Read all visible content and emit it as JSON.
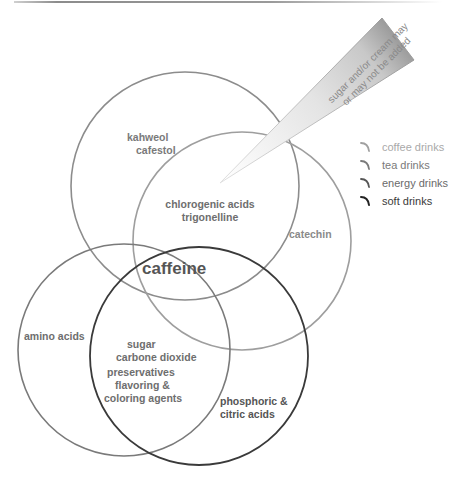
{
  "diagram": {
    "type": "venn",
    "sets": [
      {
        "id": "coffee",
        "legend_label": "coffee drinks",
        "color": "#b8b8b8",
        "stroke": "#8a8a8a",
        "exclusive_labels": [
          "kahweol",
          "cafestol"
        ]
      },
      {
        "id": "tea",
        "legend_label": "tea drinks",
        "color": "#8a8a8a",
        "stroke": "#9a9a9a",
        "exclusive_labels": [
          "catechin"
        ]
      },
      {
        "id": "energy",
        "legend_label": "energy drinks",
        "color": "#606060",
        "stroke": "#7a7a7a",
        "exclusive_labels": [
          "amino acids"
        ]
      },
      {
        "id": "soft",
        "legend_label": "soft drinks",
        "color": "#2e2e2e",
        "stroke": "#3a3a3a",
        "exclusive_labels": [
          "phosphoric &",
          "citric acids"
        ]
      }
    ],
    "shared_labels": {
      "coffee_tea": [
        "chlorogenic acids",
        "trigonelline"
      ],
      "all": "caffeine",
      "energy_soft": [
        "sugar",
        "carbone dioxide",
        "preservatives",
        "flavoring &",
        "coloring agents"
      ]
    },
    "callout": {
      "line1": "sugar and/or cream may",
      "line2": "or may not be added"
    }
  },
  "legend": {
    "items": [
      {
        "label": "coffee drinks",
        "color": "#a9a9a9",
        "icon_color": "#9a9a9a"
      },
      {
        "label": "tea drinks",
        "color": "#7a7a7a",
        "icon_color": "#7a7a7a"
      },
      {
        "label": "energy drinks",
        "color": "#6a6a6a",
        "icon_color": "#555555"
      },
      {
        "label": "soft drinks",
        "color": "#3a3a3a",
        "icon_color": "#222222"
      }
    ]
  }
}
